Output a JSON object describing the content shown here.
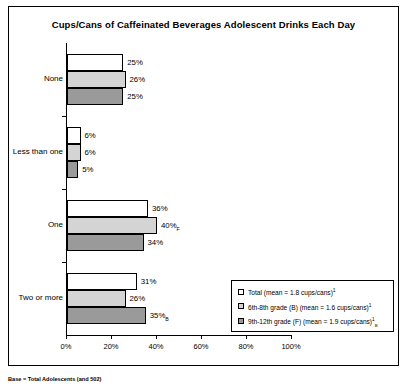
{
  "chart_data": {
    "type": "bar",
    "orientation": "horizontal",
    "title": "Cups/Cans of Caffeinated Beverages Adolescent Drinks Each Day",
    "categories": [
      "None",
      "Less than one",
      "One",
      "Two or more"
    ],
    "series": [
      {
        "name": "Total",
        "legend_label": "Total  (mean = 1.8 cups/cans)",
        "legend_sup": "1",
        "legend_sub": "",
        "mean": 1.8,
        "values": [
          25,
          6,
          36,
          31
        ],
        "value_labels": [
          "25%",
          "6%",
          "36%",
          "31%"
        ],
        "value_label_subs": [
          "",
          "",
          "",
          ""
        ],
        "fill": "#ffffff"
      },
      {
        "name": "6th-8th grade (B)",
        "legend_label": "6th-8th grade (B)  (mean = 1.6 cups/cans)",
        "legend_sup": "1",
        "legend_sub": "",
        "mean": 1.6,
        "values": [
          26,
          6,
          40,
          26
        ],
        "value_labels": [
          "26%",
          "6%",
          "40%",
          "26%"
        ],
        "value_label_subs": [
          "",
          "",
          "F",
          ""
        ],
        "fill": "#d4d4d4"
      },
      {
        "name": "9th-12th grade (F)",
        "legend_label": "9th-12th grade (F)  (mean = 1.9 cups/cans)",
        "legend_sup": "1",
        "legend_sub": "B",
        "mean": 1.9,
        "values": [
          25,
          5,
          34,
          35
        ],
        "value_labels": [
          "25%",
          "5%",
          "34%",
          "35%"
        ],
        "value_label_subs": [
          "",
          "",
          "",
          "B"
        ],
        "fill": "#9a9a9a"
      }
    ],
    "xlabel": "",
    "ylabel": "",
    "xlim": [
      0,
      100
    ],
    "xticks": [
      0,
      20,
      40,
      60,
      80,
      100
    ],
    "xtick_labels": [
      "0%",
      "20%",
      "40%",
      "60%",
      "80%",
      "100%"
    ],
    "grid": false,
    "legend_position": "bottom-right"
  },
  "footnote": "Base = Total Adolescents (and 502)"
}
